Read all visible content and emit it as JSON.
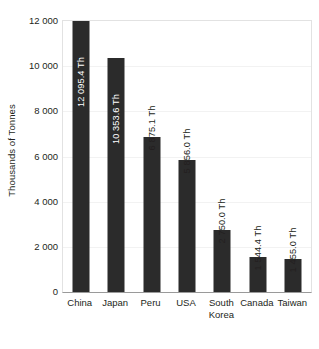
{
  "chart_data": {
    "type": "bar",
    "title": "",
    "subtitle": "",
    "xlabel": "",
    "ylabel": "Thousands of Tonnes",
    "ylim": [
      0,
      12000
    ],
    "ytick_labels": [
      "12 000",
      "10 000",
      "8 000",
      "6 000",
      "4 000",
      "2 000",
      "0"
    ],
    "ytick_values": [
      12000,
      10000,
      8000,
      6000,
      4000,
      2000,
      0
    ],
    "grid": true,
    "legend": null,
    "categories": [
      "China",
      "Japan",
      "Peru",
      "USA",
      "South Korea",
      "Canada",
      "Taiwan"
    ],
    "category_label_lines": [
      [
        "China"
      ],
      [
        "Japan"
      ],
      [
        "Peru"
      ],
      [
        "USA"
      ],
      [
        "South",
        "Korea"
      ],
      [
        "Canada"
      ],
      [
        "Taiwan"
      ]
    ],
    "values": [
      12095.4,
      10353.6,
      6875.1,
      5856.0,
      2750.0,
      1544.4,
      1455.0
    ],
    "data_labels": [
      "12 095.4 Th",
      "10 353.6 Th",
      "6 875.1 Th",
      "5 856.0 Th",
      "2 750.0 Th",
      "1 544.4 Th",
      "1 455.0 Th"
    ],
    "data_label_placement": [
      "inside",
      "inside",
      "outside",
      "outside",
      "outside",
      "outside",
      "outside"
    ],
    "bar_color": "#2b2b2b",
    "inside_label_color": "#ffffff",
    "outside_label_color": "#231f20",
    "plot_border_color": "#e2e2e2",
    "axis_line_color": "#9a9a9a",
    "gridline_color": "#f2f2f2",
    "background_color": "#ffffff"
  }
}
